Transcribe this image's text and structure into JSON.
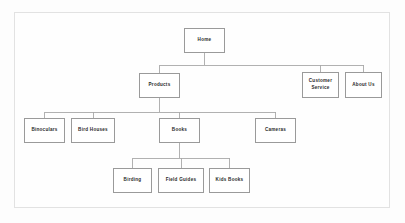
{
  "diagram": {
    "type": "site-map-tree",
    "title": "",
    "colors": {
      "page_background": "#fdfdfd",
      "frame_border": "#e2e2e2",
      "node_fill": "#ffffff",
      "node_border": "#9a9a9a",
      "node_text": "#2b2b2b",
      "connector": "#a8a8a8"
    },
    "nodes": [
      {
        "id": "home",
        "label": "Home",
        "level": 0,
        "x": 184,
        "y": 28,
        "w": 41,
        "h": 25
      },
      {
        "id": "products",
        "label": "Products",
        "level": 1,
        "x": 139,
        "y": 73,
        "w": 41,
        "h": 25
      },
      {
        "id": "customer-service",
        "label": "Customer\nService",
        "level": 1,
        "x": 302,
        "y": 72,
        "w": 37,
        "h": 26
      },
      {
        "id": "about-us",
        "label": "About Us",
        "level": 1,
        "x": 345,
        "y": 72,
        "w": 37,
        "h": 26
      },
      {
        "id": "binoculars",
        "label": "Binoculars",
        "level": 2,
        "x": 24,
        "y": 118,
        "w": 41,
        "h": 25
      },
      {
        "id": "bird-houses",
        "label": "Bird Houses",
        "level": 2,
        "x": 71,
        "y": 118,
        "w": 44,
        "h": 25
      },
      {
        "id": "books",
        "label": "Books",
        "level": 2,
        "x": 159,
        "y": 118,
        "w": 41,
        "h": 25
      },
      {
        "id": "cameras",
        "label": "Cameras",
        "level": 2,
        "x": 255,
        "y": 118,
        "w": 41,
        "h": 25
      },
      {
        "id": "birding",
        "label": "Birding",
        "level": 3,
        "x": 113,
        "y": 168,
        "w": 39,
        "h": 25
      },
      {
        "id": "field-guides",
        "label": "Field Guides",
        "level": 3,
        "x": 158,
        "y": 168,
        "w": 46,
        "h": 25
      },
      {
        "id": "kids-books",
        "label": "Kids  Books",
        "level": 3,
        "x": 209,
        "y": 168,
        "w": 41,
        "h": 25
      }
    ],
    "edges": [
      {
        "from": "home",
        "to": "products"
      },
      {
        "from": "home",
        "to": "customer-service"
      },
      {
        "from": "home",
        "to": "about-us"
      },
      {
        "from": "products",
        "to": "binoculars"
      },
      {
        "from": "products",
        "to": "bird-houses"
      },
      {
        "from": "products",
        "to": "books"
      },
      {
        "from": "products",
        "to": "cameras"
      },
      {
        "from": "books",
        "to": "birding"
      },
      {
        "from": "books",
        "to": "field-guides"
      },
      {
        "from": "books",
        "to": "kids-books"
      }
    ],
    "bus_lines": [
      {
        "parent": "home",
        "y": 65
      },
      {
        "parent": "products",
        "y": 112
      },
      {
        "parent": "books",
        "y": 158
      }
    ]
  }
}
